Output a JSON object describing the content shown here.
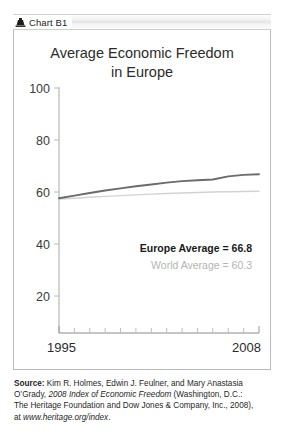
{
  "header": {
    "icon": "chart-marker-icon",
    "label": "Chart B1"
  },
  "chart_data": {
    "type": "line",
    "title": "Average Economic Freedom in Europe",
    "title_line1": "Average Economic Freedom",
    "title_line2": "in Europe",
    "xlabel": "",
    "ylabel": "",
    "grid": false,
    "legend_position": "inside-bottom-right",
    "xlim": [
      1995,
      2008
    ],
    "ylim": [
      10,
      100
    ],
    "yticks": [
      100,
      80,
      60,
      40,
      20
    ],
    "ytick_labels": [
      "100",
      "80",
      "60",
      "40",
      "20"
    ],
    "xticks": [
      1995,
      1996,
      1997,
      1998,
      1999,
      2000,
      2001,
      2002,
      2003,
      2004,
      2005,
      2006,
      2007,
      2008
    ],
    "xtick_labels_shown": [
      "1995",
      "2008"
    ],
    "x": [
      1995,
      1996,
      1997,
      1998,
      1999,
      2000,
      2001,
      2002,
      2003,
      2004,
      2005,
      2006,
      2007,
      2008
    ],
    "series": [
      {
        "name": "Europe Average",
        "color": "#6b6b6b",
        "values": [
          57.6,
          58.6,
          59.6,
          60.6,
          61.4,
          62.2,
          62.9,
          63.6,
          64.2,
          64.5,
          64.8,
          66.0,
          66.6,
          66.8
        ]
      },
      {
        "name": "World Average",
        "color": "#d2d2d2",
        "values": [
          57.3,
          57.6,
          58.0,
          58.3,
          58.6,
          58.9,
          59.2,
          59.4,
          59.6,
          59.8,
          60.0,
          60.1,
          60.2,
          60.3
        ]
      }
    ],
    "annotations": [
      {
        "text": "Europe Average = 66.8",
        "color": "#1a1a1a",
        "bold": true
      },
      {
        "text": "World Average = 60.3",
        "color": "#b4b4b4",
        "bold": false
      }
    ]
  },
  "source": {
    "label": "Source:",
    "line1_rest": " Kim R. Holmes, Edwin J. Feulner, and Mary Anastasia",
    "line2_a": "O’Grady, ",
    "line2_italic": "2008 Index of Economic Freedom",
    "line2_b": " (Washington, D.C.:",
    "line3": "The Heritage Foundation and Dow Jones & Company, Inc., 2008),",
    "line4_a": "at ",
    "line4_italic": "www.heritage.org/index",
    "line4_b": "."
  }
}
